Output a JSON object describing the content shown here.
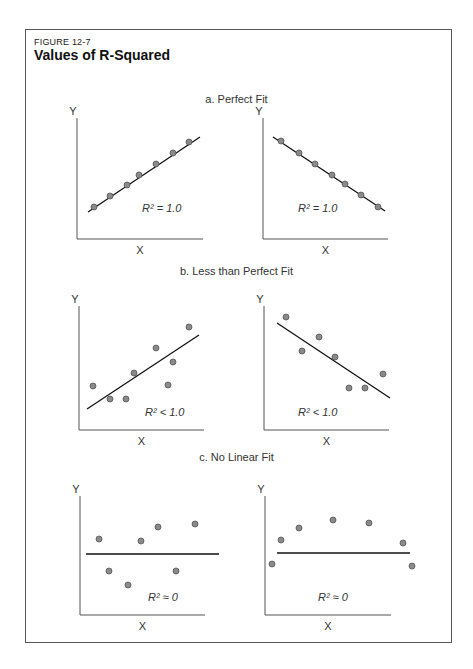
{
  "figure": {
    "label": "FIGURE 12-7",
    "title": "Values of R-Squared"
  },
  "sections": [
    {
      "title": "a. Perfect Fit",
      "top": 93
    },
    {
      "title": "b. Less than Perfect Fit",
      "top": 265
    },
    {
      "title": "c. No Linear Fit",
      "top": 451
    }
  ],
  "chart_data": [
    {
      "type": "scatter",
      "title": "a. Perfect Fit (positive)",
      "xlabel": "X",
      "ylabel": "Y",
      "annotation": "R² = 1.0",
      "axes": {
        "ox": 77,
        "oy": 239,
        "xend": 203,
        "ytop": 118
      },
      "line": [
        [
          88,
          212
        ],
        [
          200,
          137
        ]
      ],
      "points": [
        [
          94,
          207
        ],
        [
          110,
          196
        ],
        [
          127,
          185
        ],
        [
          139,
          175
        ],
        [
          156,
          164
        ],
        [
          173,
          153
        ],
        [
          189,
          142
        ]
      ],
      "r2_pos": [
        142,
        212
      ]
    },
    {
      "type": "scatter",
      "title": "a. Perfect Fit (negative)",
      "xlabel": "X",
      "ylabel": "Y",
      "annotation": "R² = 1.0",
      "axes": {
        "ox": 263,
        "oy": 239,
        "xend": 388,
        "ytop": 118
      },
      "line": [
        [
          273,
          137
        ],
        [
          385,
          211
        ]
      ],
      "points": [
        [
          281,
          141
        ],
        [
          299,
          153
        ],
        [
          315,
          164
        ],
        [
          332,
          175
        ],
        [
          345,
          184
        ],
        [
          361,
          195
        ],
        [
          378,
          207
        ]
      ],
      "r2_pos": [
        298,
        212
      ]
    },
    {
      "type": "scatter",
      "title": "b. Less than Perfect Fit (positive)",
      "xlabel": "X",
      "ylabel": "Y",
      "annotation": "R² < 1.0",
      "axes": {
        "ox": 79,
        "oy": 430,
        "xend": 204,
        "ytop": 306
      },
      "line": [
        [
          87,
          409
        ],
        [
          199,
          335
        ]
      ],
      "points": [
        [
          93,
          386
        ],
        [
          110,
          399
        ],
        [
          126,
          399
        ],
        [
          134,
          373
        ],
        [
          156,
          348
        ],
        [
          173,
          362
        ],
        [
          168,
          385
        ],
        [
          189,
          327
        ]
      ],
      "r2_pos": [
        145,
        416
      ]
    },
    {
      "type": "scatter",
      "title": "b. Less than Perfect Fit (negative)",
      "xlabel": "X",
      "ylabel": "Y",
      "annotation": "R² < 1.0",
      "axes": {
        "ox": 264,
        "oy": 430,
        "xend": 389,
        "ytop": 306
      },
      "line": [
        [
          277,
          323
        ],
        [
          390,
          398
        ]
      ],
      "points": [
        [
          286,
          317
        ],
        [
          302,
          351
        ],
        [
          319,
          337
        ],
        [
          335,
          357
        ],
        [
          349,
          388
        ],
        [
          365,
          388
        ],
        [
          383,
          374
        ]
      ],
      "r2_pos": [
        298,
        416
      ]
    },
    {
      "type": "scatter",
      "title": "c. No Linear Fit (arc)",
      "xlabel": "X",
      "ylabel": "Y",
      "annotation": "R² ≈ 0",
      "axes": {
        "ox": 80,
        "oy": 615,
        "xend": 205,
        "ytop": 496
      },
      "line": [
        [
          86,
          554
        ],
        [
          219,
          554
        ]
      ],
      "points": [
        [
          99,
          539
        ],
        [
          109,
          571
        ],
        [
          128,
          585
        ],
        [
          141,
          541
        ],
        [
          158,
          527
        ],
        [
          176,
          571
        ],
        [
          195,
          524
        ]
      ],
      "r2_pos": [
        148,
        601
      ]
    },
    {
      "type": "scatter",
      "title": "c. No Linear Fit (inverted U)",
      "xlabel": "X",
      "ylabel": "Y",
      "annotation": "R² ≈ 0",
      "axes": {
        "ox": 265,
        "oy": 615,
        "xend": 391,
        "ytop": 496
      },
      "line": [
        [
          277,
          553
        ],
        [
          410,
          553
        ]
      ],
      "points": [
        [
          272,
          564
        ],
        [
          281,
          540
        ],
        [
          299,
          528
        ],
        [
          333,
          520
        ],
        [
          369,
          523
        ],
        [
          403,
          543
        ],
        [
          412,
          566
        ]
      ],
      "r2_pos": [
        318,
        601
      ]
    }
  ]
}
